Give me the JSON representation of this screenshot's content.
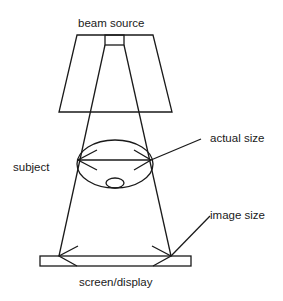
{
  "diagram": {
    "labels": {
      "beam_source": "beam source",
      "subject": "subject",
      "actual_size": "actual size",
      "image_size": "image size",
      "screen_display": "screen/display"
    },
    "colors": {
      "stroke": "#1a1a1a",
      "background": "#ffffff"
    }
  }
}
